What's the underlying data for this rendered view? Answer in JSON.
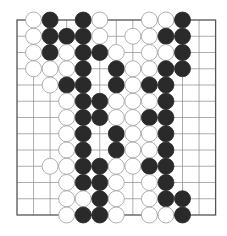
{
  "diagram": {
    "type": "go-board-fragment",
    "grid": {
      "columns": 13,
      "rows": 13,
      "origin_x": 17,
      "origin_y": 20,
      "spacing_x": 16.55,
      "spacing_y": 16.25,
      "line_color": "#8a8a8a",
      "border_color": "#555555"
    },
    "stone_radius": 8,
    "colors": {
      "black": "#2a2a2a",
      "white_fill": "#ffffff",
      "white_stroke": "#9a9a9a"
    },
    "stones": [
      {
        "row": 0,
        "col": 1,
        "color": "white"
      },
      {
        "row": 0,
        "col": 2,
        "color": "black"
      },
      {
        "row": 0,
        "col": 4,
        "color": "black"
      },
      {
        "row": 0,
        "col": 5,
        "color": "white"
      },
      {
        "row": 0,
        "col": 8,
        "color": "white"
      },
      {
        "row": 0,
        "col": 9,
        "color": "white"
      },
      {
        "row": 0,
        "col": 10,
        "color": "black"
      },
      {
        "row": 1,
        "col": 1,
        "color": "white"
      },
      {
        "row": 1,
        "col": 2,
        "color": "black"
      },
      {
        "row": 1,
        "col": 3,
        "color": "black"
      },
      {
        "row": 1,
        "col": 4,
        "color": "black"
      },
      {
        "row": 1,
        "col": 5,
        "color": "white"
      },
      {
        "row": 1,
        "col": 7,
        "color": "white"
      },
      {
        "row": 1,
        "col": 8,
        "color": "white"
      },
      {
        "row": 1,
        "col": 9,
        "color": "black"
      },
      {
        "row": 1,
        "col": 10,
        "color": "black"
      },
      {
        "row": 2,
        "col": 1,
        "color": "white"
      },
      {
        "row": 2,
        "col": 2,
        "color": "black"
      },
      {
        "row": 2,
        "col": 3,
        "color": "white"
      },
      {
        "row": 2,
        "col": 4,
        "color": "black"
      },
      {
        "row": 2,
        "col": 5,
        "color": "black"
      },
      {
        "row": 2,
        "col": 6,
        "color": "white"
      },
      {
        "row": 2,
        "col": 8,
        "color": "white"
      },
      {
        "row": 2,
        "col": 9,
        "color": "white"
      },
      {
        "row": 2,
        "col": 10,
        "color": "black"
      },
      {
        "row": 3,
        "col": 1,
        "color": "white"
      },
      {
        "row": 3,
        "col": 2,
        "color": "white"
      },
      {
        "row": 3,
        "col": 3,
        "color": "white"
      },
      {
        "row": 3,
        "col": 4,
        "color": "black"
      },
      {
        "row": 3,
        "col": 6,
        "color": "black"
      },
      {
        "row": 3,
        "col": 7,
        "color": "white"
      },
      {
        "row": 3,
        "col": 8,
        "color": "white"
      },
      {
        "row": 3,
        "col": 9,
        "color": "black"
      },
      {
        "row": 3,
        "col": 10,
        "color": "black"
      },
      {
        "row": 4,
        "col": 2,
        "color": "white"
      },
      {
        "row": 4,
        "col": 3,
        "color": "black"
      },
      {
        "row": 4,
        "col": 4,
        "color": "black"
      },
      {
        "row": 4,
        "col": 6,
        "color": "black"
      },
      {
        "row": 4,
        "col": 7,
        "color": "white"
      },
      {
        "row": 4,
        "col": 8,
        "color": "black"
      },
      {
        "row": 4,
        "col": 9,
        "color": "black"
      },
      {
        "row": 5,
        "col": 3,
        "color": "white"
      },
      {
        "row": 5,
        "col": 4,
        "color": "black"
      },
      {
        "row": 5,
        "col": 5,
        "color": "black"
      },
      {
        "row": 5,
        "col": 6,
        "color": "white"
      },
      {
        "row": 5,
        "col": 7,
        "color": "white"
      },
      {
        "row": 5,
        "col": 8,
        "color": "white"
      },
      {
        "row": 5,
        "col": 9,
        "color": "black"
      },
      {
        "row": 6,
        "col": 3,
        "color": "white"
      },
      {
        "row": 6,
        "col": 4,
        "color": "black"
      },
      {
        "row": 6,
        "col": 5,
        "color": "black"
      },
      {
        "row": 6,
        "col": 6,
        "color": "white"
      },
      {
        "row": 6,
        "col": 7,
        "color": "white"
      },
      {
        "row": 6,
        "col": 8,
        "color": "black"
      },
      {
        "row": 6,
        "col": 9,
        "color": "black"
      },
      {
        "row": 7,
        "col": 3,
        "color": "white"
      },
      {
        "row": 7,
        "col": 4,
        "color": "black"
      },
      {
        "row": 7,
        "col": 6,
        "color": "black"
      },
      {
        "row": 7,
        "col": 7,
        "color": "white"
      },
      {
        "row": 7,
        "col": 8,
        "color": "white"
      },
      {
        "row": 7,
        "col": 9,
        "color": "black"
      },
      {
        "row": 8,
        "col": 3,
        "color": "white"
      },
      {
        "row": 8,
        "col": 4,
        "color": "black"
      },
      {
        "row": 8,
        "col": 6,
        "color": "black"
      },
      {
        "row": 8,
        "col": 7,
        "color": "white"
      },
      {
        "row": 8,
        "col": 8,
        "color": "white"
      },
      {
        "row": 8,
        "col": 9,
        "color": "black"
      },
      {
        "row": 9,
        "col": 2,
        "color": "white"
      },
      {
        "row": 9,
        "col": 3,
        "color": "white"
      },
      {
        "row": 9,
        "col": 4,
        "color": "black"
      },
      {
        "row": 9,
        "col": 5,
        "color": "black"
      },
      {
        "row": 9,
        "col": 6,
        "color": "white"
      },
      {
        "row": 9,
        "col": 7,
        "color": "white"
      },
      {
        "row": 9,
        "col": 8,
        "color": "black"
      },
      {
        "row": 9,
        "col": 9,
        "color": "black"
      },
      {
        "row": 10,
        "col": 3,
        "color": "white"
      },
      {
        "row": 10,
        "col": 4,
        "color": "black"
      },
      {
        "row": 10,
        "col": 5,
        "color": "black"
      },
      {
        "row": 10,
        "col": 6,
        "color": "white"
      },
      {
        "row": 10,
        "col": 8,
        "color": "white"
      },
      {
        "row": 10,
        "col": 9,
        "color": "black"
      },
      {
        "row": 11,
        "col": 3,
        "color": "white"
      },
      {
        "row": 11,
        "col": 4,
        "color": "white"
      },
      {
        "row": 11,
        "col": 5,
        "color": "black"
      },
      {
        "row": 11,
        "col": 6,
        "color": "white"
      },
      {
        "row": 11,
        "col": 8,
        "color": "white"
      },
      {
        "row": 11,
        "col": 9,
        "color": "black"
      },
      {
        "row": 11,
        "col": 10,
        "color": "black"
      },
      {
        "row": 12,
        "col": 3,
        "color": "white"
      },
      {
        "row": 12,
        "col": 4,
        "color": "black"
      },
      {
        "row": 12,
        "col": 5,
        "color": "black"
      },
      {
        "row": 12,
        "col": 6,
        "color": "white"
      },
      {
        "row": 12,
        "col": 8,
        "color": "white"
      },
      {
        "row": 12,
        "col": 9,
        "color": "white"
      },
      {
        "row": 12,
        "col": 10,
        "color": "black"
      }
    ]
  }
}
